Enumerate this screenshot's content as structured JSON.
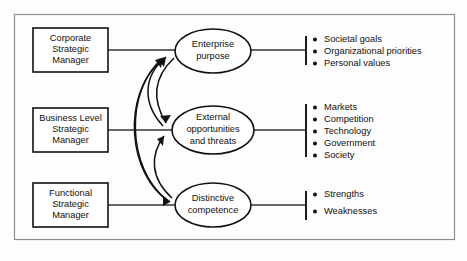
{
  "figure": {
    "colors": {
      "ink": "#111111",
      "frame": "#8e8e8e",
      "connector": "#333333",
      "background": "#ffffff"
    },
    "boxes": [
      {
        "id": "corporate",
        "line1": "Corporate",
        "line2": "Strategic",
        "line3": "Manager"
      },
      {
        "id": "business",
        "line1": "Business Level",
        "line2": "Strategic",
        "line3": "Manager"
      },
      {
        "id": "functional",
        "line1": "Functional",
        "line2": "Strategic",
        "line3": "Manager"
      }
    ],
    "ellipses": [
      {
        "id": "enterprise-purpose",
        "line1": "Enterprise",
        "line2": "purpose",
        "line3": ""
      },
      {
        "id": "external-opportunities",
        "line1": "External",
        "line2": "opportunities",
        "line3": "and threats"
      },
      {
        "id": "distinctive-competence",
        "line1": "Distinctive",
        "line2": "competence",
        "line3": ""
      }
    ],
    "bullet_groups": [
      {
        "id": "enterprise-purpose-items",
        "items": [
          "Societal goals",
          "Organizational priorities",
          "Personal values"
        ]
      },
      {
        "id": "external-opportunities-items",
        "items": [
          "Markets",
          "Competition",
          "Technology",
          "Government",
          "Society"
        ]
      },
      {
        "id": "distinctive-competence-items",
        "items": [
          "Strengths",
          "Weaknesses"
        ]
      }
    ]
  }
}
